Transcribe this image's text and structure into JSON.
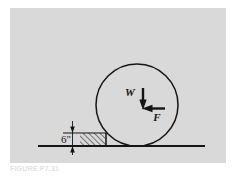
{
  "figure": {
    "caption": "FIGURE P7.31",
    "panel_color": "#d9d9d9",
    "background_color": "#ffffff",
    "line_color": "#151515",
    "labels": {
      "weight": "W",
      "force": "F",
      "step_height": "6\""
    },
    "geometry": {
      "circle": {
        "cx": 137,
        "cy": 105,
        "r": 41
      },
      "ground_line": {
        "x1": 38,
        "x2": 205,
        "y": 146
      },
      "step_block": {
        "x1": 80,
        "x2": 106,
        "y_top": 133,
        "y_bottom": 146
      },
      "step_top_extension": {
        "x1": 63,
        "x2": 80,
        "y": 133
      },
      "dimension_line": {
        "x": 72,
        "y_top": 121,
        "y_bottom": 155
      },
      "weight_arrow": {
        "x": 143,
        "y1": 88,
        "y2": 109
      },
      "force_arrow": {
        "y": 108,
        "x1": 165,
        "x2": 143
      }
    },
    "hatching": {
      "angle_deg": 45,
      "spacing_px": 4
    }
  }
}
